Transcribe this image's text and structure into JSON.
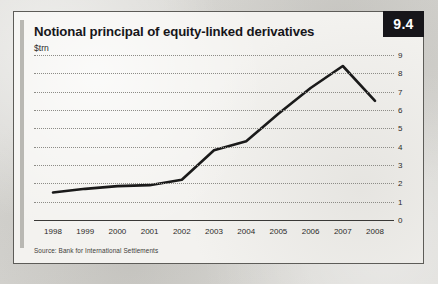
{
  "figure": {
    "badge": "9.4",
    "title": "Notional principal of equity-linked derivatives",
    "subtitle": "$trn",
    "source": "Source: Bank for International Settlements",
    "accent_color": "#17161a",
    "card_background": "#f3f2ef",
    "page_background": "#d8d7d3",
    "line_color": "#1a1a1a",
    "grid_color": "#8d8c87"
  },
  "chart_data": {
    "type": "line",
    "title": "Notional principal of equity-linked derivatives",
    "subtitle": "$trn",
    "xlabel": "",
    "ylabel": "$trn",
    "categories": [
      "1998",
      "1999",
      "2000",
      "2001",
      "2002",
      "2003",
      "2004",
      "2005",
      "2006",
      "2007",
      "2008"
    ],
    "x": [
      1998,
      1999,
      2000,
      2001,
      2002,
      2003,
      2004,
      2005,
      2006,
      2007,
      2008
    ],
    "values": [
      1.5,
      1.7,
      1.85,
      1.9,
      2.2,
      3.8,
      4.3,
      5.8,
      7.2,
      8.4,
      6.5
    ],
    "series": [
      {
        "name": "Notional principal of equity-linked derivatives",
        "values": [
          1.5,
          1.7,
          1.85,
          1.9,
          2.2,
          3.8,
          4.3,
          5.8,
          7.2,
          8.4,
          6.5
        ]
      }
    ],
    "ylim": [
      0,
      9
    ],
    "yticks": [
      0,
      1,
      2,
      3,
      4,
      5,
      6,
      7,
      8,
      9
    ],
    "ytick_labels": [
      "0",
      "1",
      "2",
      "3",
      "4",
      "5",
      "6",
      "7",
      "8",
      "9"
    ],
    "xlim": [
      1998,
      2008
    ],
    "grid": true,
    "grid_style": "dotted-horizontal",
    "legend": false,
    "legend_position": "none"
  }
}
